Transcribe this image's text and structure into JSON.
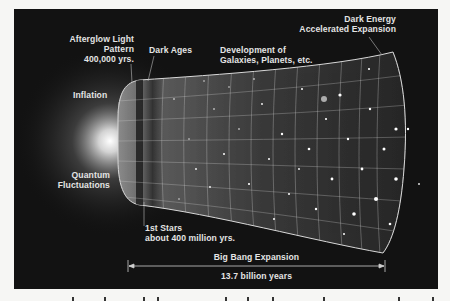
{
  "diagram": {
    "title_hint": "Timeline of the expanding universe",
    "colors": {
      "background": "#121212",
      "label": "#e4e4e4",
      "grid": "#cfcfcf",
      "page": "#f6f6f4"
    },
    "labels": {
      "afterglow": {
        "line1": "Afterglow Light",
        "line2": "Pattern",
        "line3": "400,000 yrs."
      },
      "dark_ages": {
        "line1": "Dark Ages"
      },
      "galaxies": {
        "line1": "Development of",
        "line2": "Galaxies, Planets, etc."
      },
      "dark_energy": {
        "line1": "Dark Energy",
        "line2": "Accelerated Expansion"
      },
      "inflation": {
        "line1": "Inflation"
      },
      "quantum": {
        "line1": "Quantum",
        "line2": "Fluctuations"
      },
      "first_stars": {
        "line1": "1st Stars",
        "line2": "about 400 million yrs."
      }
    },
    "timeline": {
      "title": "Big Bang Expansion",
      "duration": "13.7 billion years"
    }
  }
}
